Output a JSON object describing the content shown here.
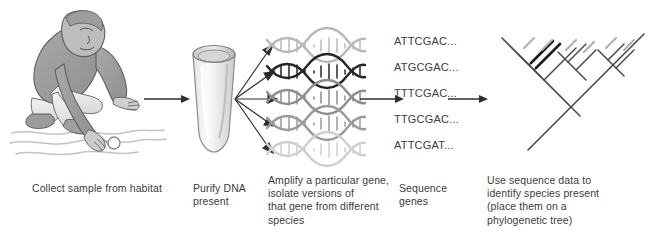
{
  "figure": {
    "background_color": "#ffffff",
    "ink_color": "#3c3c3c",
    "arrow_color": "#2f2f2f"
  },
  "steps": [
    {
      "id": "collect",
      "caption": "Collect sample from  habitat",
      "illustration": "person-crouching-collecting-water-sample-icon"
    },
    {
      "id": "purify",
      "caption": "Purify DNA\npresent",
      "illustration": "microcentrifuge-tube-icon"
    },
    {
      "id": "amplify",
      "caption": "Amplify a particular gene,\nisolate versions of\nthat gene from different\nspecies",
      "illustration": "dna-double-helix-icon"
    },
    {
      "id": "sequence",
      "caption": "Sequence\ngenes",
      "illustration": "dna-sequence-list-icon"
    },
    {
      "id": "identify",
      "caption": "Use sequence data to\nidentify species present\n(place them on a\nphylogenetic tree)",
      "illustration": "phylogenetic-tree-icon"
    }
  ],
  "sequences": [
    "ATTCGAC...",
    "ATGCGAC...",
    "TTTCGAC...",
    "TTGCGAC...",
    "ATTCGAT..."
  ],
  "helices": [
    {
      "index": 0,
      "shade": "#b9b9b9"
    },
    {
      "index": 1,
      "shade": "#262626"
    },
    {
      "index": 2,
      "shade": "#8e8e8e"
    },
    {
      "index": 3,
      "shade": "#9a9a9a"
    },
    {
      "index": 4,
      "shade": "#cfcfcf"
    }
  ],
  "arrows": [
    {
      "id": "collect-to-purify",
      "direction": "right"
    },
    {
      "id": "purify-to-amplify-fan",
      "direction": "fan-right",
      "branches": 5
    },
    {
      "id": "amplify-to-sequence",
      "direction": "right"
    },
    {
      "id": "sequence-to-tree",
      "direction": "right"
    }
  ]
}
